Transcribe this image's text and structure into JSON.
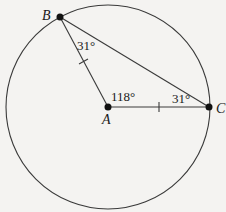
{
  "diagram": {
    "type": "circle-geometry",
    "circle": {
      "center": "A",
      "cx": 108,
      "cy": 107,
      "r": 102
    },
    "points": [
      {
        "id": "A",
        "label": "A",
        "x": 108,
        "y": 107,
        "label_x": 102,
        "label_y": 124
      },
      {
        "id": "B",
        "label": "B",
        "x": 60,
        "y": 17,
        "label_x": 42,
        "label_y": 20
      },
      {
        "id": "C",
        "label": "C",
        "x": 209,
        "y": 107,
        "label_x": 216,
        "label_y": 113
      }
    ],
    "segments": [
      {
        "from": "A",
        "to": "B",
        "tick": true
      },
      {
        "from": "A",
        "to": "C",
        "tick": true
      },
      {
        "from": "B",
        "to": "C",
        "tick": false
      }
    ],
    "angles": [
      {
        "vertex": "B",
        "label": "31°",
        "x": 77,
        "y": 50
      },
      {
        "vertex": "A",
        "label": "118°",
        "x": 111,
        "y": 101
      },
      {
        "vertex": "C",
        "label": "31°",
        "x": 172,
        "y": 103
      }
    ],
    "colors": {
      "stroke": "#3a3a3a",
      "point": "#111111",
      "background": "#f4f3f1"
    }
  }
}
